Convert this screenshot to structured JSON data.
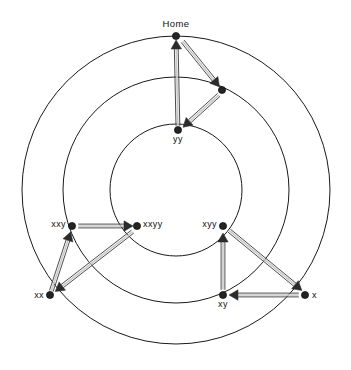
{
  "diagram": {
    "title": "Home",
    "type": "radial-state-transition-graph",
    "geometry": {
      "center_x": 176,
      "center_y": 190,
      "ring_radii": [
        66,
        113,
        154
      ]
    },
    "rings": [
      {
        "id": "inner-ring",
        "radius": 66
      },
      {
        "id": "middle-ring",
        "radius": 113
      },
      {
        "id": "outer-ring",
        "radius": 154
      }
    ],
    "nodes": [
      {
        "id": "home",
        "label": "Home",
        "x": 176,
        "y": 36,
        "label_dx": 0,
        "label_dy": -9,
        "anchor": "middle",
        "ring": "outer"
      },
      {
        "id": "mid_top",
        "label": "",
        "x": 222,
        "y": 90,
        "label_dx": 0,
        "label_dy": -7,
        "anchor": "middle",
        "ring": "middle"
      },
      {
        "id": "yy",
        "label": "yy",
        "x": 178,
        "y": 130,
        "label_dx": 0,
        "label_dy": 12,
        "anchor": "middle",
        "ring": "inner"
      },
      {
        "id": "xxy",
        "label": "xxy",
        "x": 72,
        "y": 226,
        "label_dx": -6,
        "label_dy": 1,
        "anchor": "end",
        "ring": "middle"
      },
      {
        "id": "xxyy",
        "label": "xxyy",
        "x": 137,
        "y": 226,
        "label_dx": 6,
        "label_dy": 1,
        "anchor": "start",
        "ring": "inner"
      },
      {
        "id": "xyy",
        "label": "xyy",
        "x": 223,
        "y": 226,
        "label_dx": -6,
        "label_dy": 1,
        "anchor": "end",
        "ring": "inner"
      },
      {
        "id": "xx",
        "label": "xx",
        "x": 50,
        "y": 295,
        "label_dx": -6,
        "label_dy": 3,
        "anchor": "end",
        "ring": "outer"
      },
      {
        "id": "xy",
        "label": "xy",
        "x": 223,
        "y": 295,
        "label_dx": 0,
        "label_dy": 12,
        "anchor": "middle",
        "ring": "middle"
      },
      {
        "id": "x",
        "label": "x",
        "x": 305,
        "y": 295,
        "label_dx": 7,
        "label_dy": 3,
        "anchor": "start",
        "ring": "outer"
      }
    ],
    "edges": [
      {
        "id": "edge-yy-home",
        "from": "yy",
        "to": "home",
        "from_x": 178,
        "from_y": 130,
        "to_x": 176,
        "to_y": 36
      },
      {
        "id": "edge-home-midtop",
        "from": "home",
        "to": "mid_top",
        "from_x": 180,
        "from_y": 38,
        "to_x": 222,
        "to_y": 90
      },
      {
        "id": "edge-midtop-yy",
        "from": "mid_top",
        "to": "yy",
        "from_x": 222,
        "from_y": 92,
        "to_x": 180,
        "to_y": 130
      },
      {
        "id": "edge-xx-xxy",
        "from": "xx",
        "to": "xxy",
        "from_x": 50,
        "from_y": 295,
        "to_x": 72,
        "to_y": 228
      },
      {
        "id": "edge-xxy-xxyy",
        "from": "xxy",
        "to": "xxyy",
        "from_x": 74,
        "from_y": 226,
        "to_x": 137,
        "to_y": 226
      },
      {
        "id": "edge-xxyy-xx",
        "from": "xxyy",
        "to": "xx",
        "from_x": 136,
        "from_y": 229,
        "to_x": 52,
        "to_y": 294
      },
      {
        "id": "edge-xy-xyy",
        "from": "xy",
        "to": "xyy",
        "from_x": 223,
        "from_y": 294,
        "to_x": 223,
        "to_y": 229
      },
      {
        "id": "edge-xyy-x",
        "from": "xyy",
        "to": "x",
        "from_x": 226,
        "from_y": 228,
        "to_x": 305,
        "to_y": 293
      },
      {
        "id": "edge-x-xy",
        "from": "x",
        "to": "xy",
        "from_x": 303,
        "from_y": 295,
        "to_x": 225,
        "to_y": 295
      }
    ],
    "colors": {
      "background": "#ffffff",
      "ring_stroke": "#1a1a1a",
      "edge_outline": "#4d4d4d",
      "edge_fill": "#c9c9c9",
      "node_fill": "#242424",
      "label_text": "#111111"
    }
  }
}
